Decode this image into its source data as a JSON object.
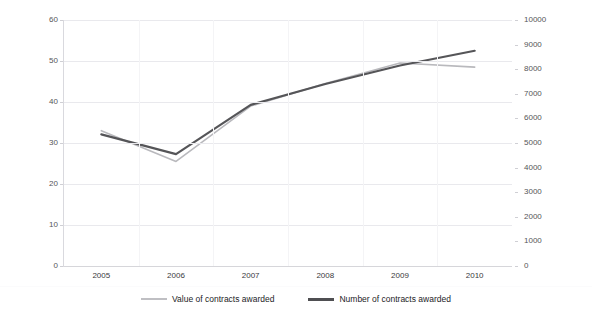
{
  "chart_data": {
    "type": "line",
    "title": "",
    "subtitle": "",
    "xlabel": "",
    "ylabel": "Value of Awarded Procurement Contracts (Billion TL)",
    "ylabel_secondary": "",
    "categories": [
      "2005",
      "2006",
      "2007",
      "2008",
      "2009",
      "2010"
    ],
    "x": [
      2005,
      2006,
      2007,
      2008,
      2009,
      2010
    ],
    "ylim": [
      0,
      60
    ],
    "ylim_secondary": [
      0,
      10000
    ],
    "yticks": [
      "0",
      "10",
      "20",
      "30",
      "40",
      "50",
      "60"
    ],
    "ytick_values": [
      0,
      10,
      20,
      30,
      40,
      50,
      60
    ],
    "yticks_secondary": [
      "0",
      "1000",
      "2000",
      "3000",
      "4000",
      "5000",
      "6000",
      "7000",
      "8000",
      "9000",
      "10000"
    ],
    "ytick_values_secondary": [
      0,
      1000,
      2000,
      3000,
      4000,
      5000,
      6000,
      7000,
      8000,
      9000,
      10000
    ],
    "grid": true,
    "legend_position": "bottom",
    "series": [
      {
        "name": "Value of contracts awarded",
        "axis": "left",
        "color": "#b9b9bd",
        "width": 1.6,
        "values": [
          33.0,
          25.5,
          39.0,
          44.5,
          49.5,
          48.5
        ]
      },
      {
        "name": "Number of contracts awarded",
        "axis": "right",
        "color": "#555558",
        "width": 2.2,
        "values": [
          5350,
          4550,
          6550,
          7400,
          8150,
          8750
        ]
      }
    ]
  },
  "axes": {
    "left": {
      "title": "Value of Awarded Procurement Contracts (Billion TL)",
      "ticks": [
        "60",
        "50",
        "40",
        "30",
        "20",
        "10",
        "0"
      ]
    },
    "right": {
      "title": "",
      "ticks": [
        "10000",
        "9000",
        "8000",
        "7000",
        "6000",
        "5000",
        "4000",
        "3000",
        "2000",
        "1000",
        "0"
      ]
    },
    "bottom": {
      "ticks": [
        "2005",
        "2006",
        "2007",
        "2008",
        "2009",
        "2010"
      ]
    }
  },
  "legend": {
    "items": [
      {
        "label": "Value of contracts awarded",
        "color": "#bfbfc3"
      },
      {
        "label": "Number of contracts awarded",
        "color": "#4f4f52"
      }
    ]
  },
  "artifacts": {
    "top_strip": "             "
  }
}
